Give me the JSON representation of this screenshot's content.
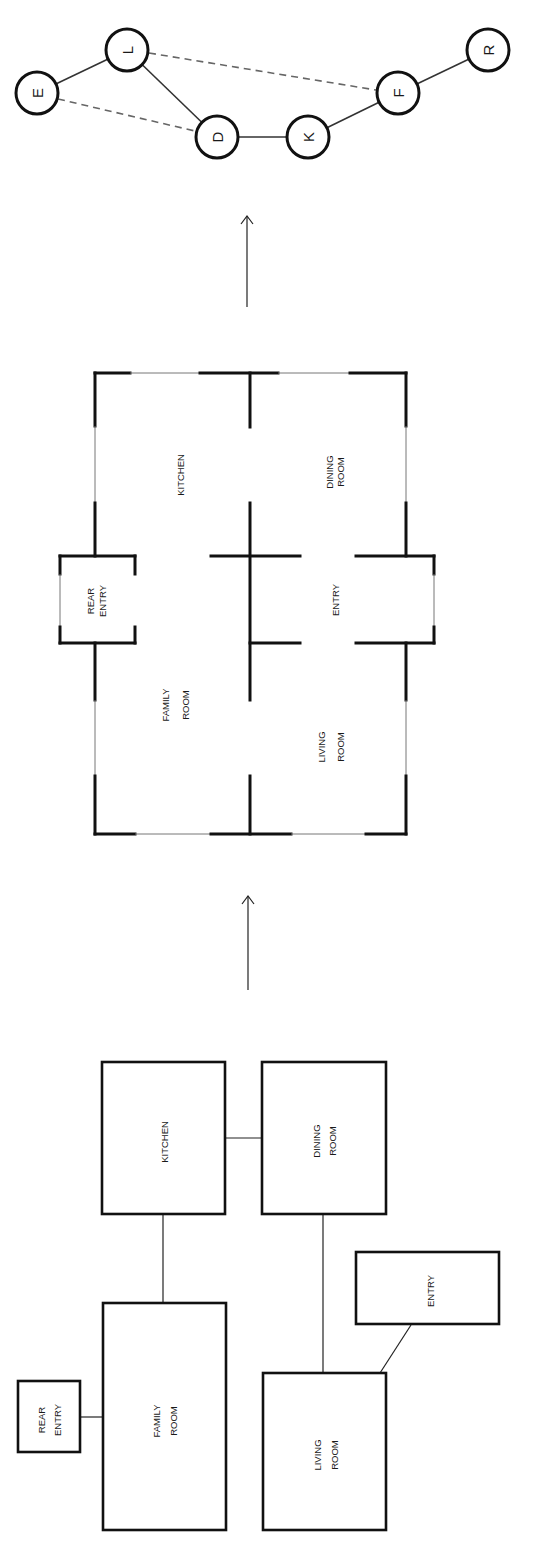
{
  "graph": {
    "nodes": [
      {
        "id": "E",
        "label": "E",
        "x": 37,
        "y": 93
      },
      {
        "id": "L",
        "label": "L",
        "x": 127,
        "y": 50
      },
      {
        "id": "D",
        "label": "D",
        "x": 217,
        "y": 137
      },
      {
        "id": "K",
        "label": "K",
        "x": 308,
        "y": 137
      },
      {
        "id": "F",
        "label": "F",
        "x": 398,
        "y": 93
      },
      {
        "id": "R",
        "label": "R",
        "x": 488,
        "y": 50
      }
    ],
    "edges": [
      {
        "from": "E",
        "to": "L",
        "style": "solid"
      },
      {
        "from": "L",
        "to": "D",
        "style": "solid"
      },
      {
        "from": "D",
        "to": "K",
        "style": "solid"
      },
      {
        "from": "K",
        "to": "F",
        "style": "solid"
      },
      {
        "from": "F",
        "to": "R",
        "style": "solid"
      },
      {
        "from": "E",
        "to": "D",
        "style": "dashed"
      },
      {
        "from": "L",
        "to": "F",
        "style": "dashed"
      }
    ]
  },
  "floor_plan": {
    "rooms": {
      "kitchen": "KITCHEN",
      "dining_1": "DINING",
      "dining_2": "ROOM",
      "rear_entry_1": "REAR",
      "rear_entry_2": "ENTRY",
      "entry": "ENTRY",
      "family_1": "FAMILY",
      "family_2": "ROOM",
      "living_1": "LIVING",
      "living_2": "ROOM"
    }
  },
  "bubble_diagram": {
    "rooms": {
      "kitchen": "KITCHEN",
      "dining_1": "DINING",
      "dining_2": "ROOM",
      "rear_entry_1": "REAR",
      "rear_entry_2": "ENTRY",
      "entry": "ENTRY",
      "family_1": "FAMILY",
      "family_2": "ROOM",
      "living_1": "LIVING",
      "living_2": "ROOM"
    },
    "connections": [
      [
        "KITCHEN",
        "DINING ROOM"
      ],
      [
        "KITCHEN",
        "FAMILY ROOM"
      ],
      [
        "DINING ROOM",
        "LIVING ROOM"
      ],
      [
        "REAR ENTRY",
        "FAMILY ROOM"
      ],
      [
        "ENTRY",
        "LIVING ROOM"
      ]
    ]
  },
  "colors": {
    "ink": "#111111",
    "dashed_edge": "#666666",
    "background": "#ffffff"
  }
}
